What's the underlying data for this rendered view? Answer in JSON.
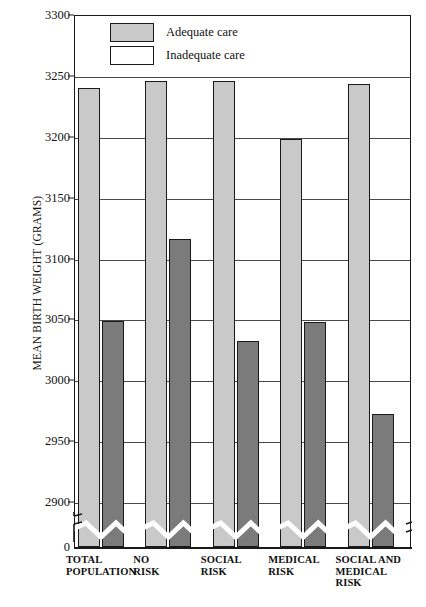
{
  "chart_data": {
    "type": "bar",
    "title": "",
    "xlabel": "",
    "ylabel": "MEAN BIRTH WEIGHT (GRAMS)",
    "ylim": [
      2900,
      3300
    ],
    "yticks": [
      3300,
      3250,
      3200,
      3150,
      3100,
      3050,
      3000,
      2950,
      2900,
      0
    ],
    "axis_break": true,
    "grid": true,
    "legend_position": "top-center-inside",
    "categories": [
      "TOTAL\nPOPULATION",
      "NO\nRISK",
      "SOCIAL\nRISK",
      "MEDICAL\nRISK",
      "SOCIAL AND\nMEDICAL\nRISK"
    ],
    "series": [
      {
        "name": "Adequate care",
        "color": "#c9c9c9",
        "values": [
          3240,
          3246,
          3246,
          3198,
          3243
        ]
      },
      {
        "name": "Inadequate care",
        "color": "#7b7b7b",
        "values": [
          3049,
          3116,
          3032,
          3048,
          2972
        ]
      }
    ]
  },
  "legend": {
    "items": [
      {
        "label": "Adequate care",
        "swatch": "gray"
      },
      {
        "label": "Inadequate care",
        "swatch": "white"
      }
    ]
  },
  "axis": {
    "zero_label": "0"
  }
}
